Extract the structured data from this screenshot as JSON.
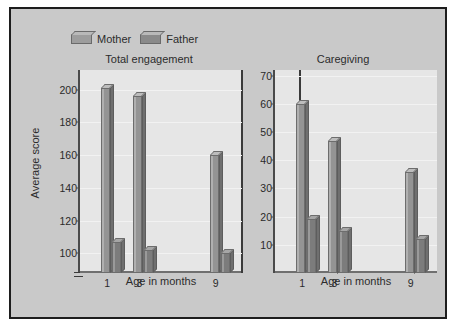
{
  "figure": {
    "legend": {
      "items": [
        {
          "label": "Mother",
          "color": "#949494",
          "icon": "legend-swatch-3d"
        },
        {
          "label": "Father",
          "color": "#7c7c7c",
          "icon": "legend-swatch-3d"
        }
      ]
    },
    "shared_ylabel": "Average score",
    "axis_break_symbol": "≈"
  },
  "chart_data": [
    {
      "type": "bar",
      "title": "Total engagement",
      "xlabel": "Age in months",
      "ylabel": "Average score",
      "categories": [
        "1",
        "3",
        "9"
      ],
      "series": [
        {
          "name": "Mother",
          "values": [
            201,
            196,
            160
          ]
        },
        {
          "name": "Father",
          "values": [
            107,
            102,
            100
          ]
        }
      ],
      "ylim": [
        88,
        212
      ],
      "yticks": [
        100,
        120,
        140,
        160,
        180,
        200
      ],
      "grid": true,
      "legend_position": "top-left",
      "axis_break": true
    },
    {
      "type": "bar",
      "title": "Caregiving",
      "xlabel": "Age in months",
      "ylabel": "Average score",
      "categories": [
        "1",
        "3",
        "9"
      ],
      "series": [
        {
          "name": "Mother",
          "values": [
            60,
            47,
            36
          ]
        },
        {
          "name": "Father",
          "values": [
            19,
            15,
            12
          ]
        }
      ],
      "ylim": [
        0,
        72
      ],
      "yticks": [
        10,
        20,
        30,
        40,
        50,
        60,
        70
      ],
      "grid": true,
      "legend_position": "top-left",
      "axis_break": false
    }
  ]
}
